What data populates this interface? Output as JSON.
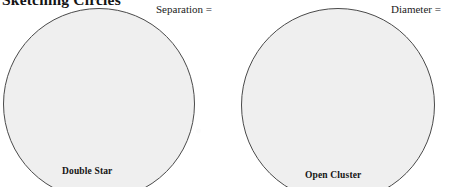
{
  "page": {
    "title": "Sketching Circles",
    "background_color": "#ffffff",
    "width": 451,
    "height": 187
  },
  "style": {
    "circle_fill": "#efefef",
    "circle_stroke": "#4a4a4a",
    "text_color": "#1a1a1a"
  },
  "fields": [
    {
      "label": "Separation ="
    },
    {
      "label": "Diameter ="
    }
  ],
  "sketch_areas": [
    {
      "caption": "Double Star",
      "field_label": "Separation =",
      "shape": "circle"
    },
    {
      "caption": "Open Cluster",
      "field_label": "Diameter =",
      "shape": "circle"
    }
  ]
}
